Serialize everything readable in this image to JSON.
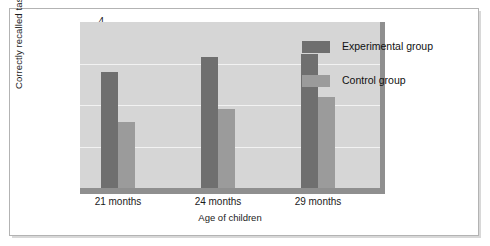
{
  "chart_data": {
    "type": "bar",
    "title": "",
    "xlabel": "Age of children",
    "ylabel": "Correctly recalled tasks",
    "categories": [
      "21 months",
      "24 months",
      "29 months"
    ],
    "series": [
      {
        "name": "Experimental group",
        "values": [
          2.8,
          3.15,
          3.22
        ],
        "color": "#6f6f6f"
      },
      {
        "name": "Control group",
        "values": [
          1.6,
          1.9,
          2.2
        ],
        "color": "#9b9b9b"
      }
    ],
    "ylim": [
      0,
      4
    ],
    "yticks": [
      0,
      1,
      2,
      3,
      4
    ],
    "ytick_labels": [
      "0",
      "1",
      "2",
      "3",
      "4"
    ],
    "grid": true,
    "grid_axis": "y",
    "grid_color": "#f2f2f2",
    "legend_position": "upper right inside",
    "plot_background": "#d6d6d6",
    "figure_background": "#ffffff",
    "axis_line_color": "#8f8f8f"
  },
  "legend": {
    "items": [
      {
        "label": "Experimental group",
        "color": "#6f6f6f"
      },
      {
        "label": "Control group",
        "color": "#9b9b9b"
      }
    ]
  }
}
